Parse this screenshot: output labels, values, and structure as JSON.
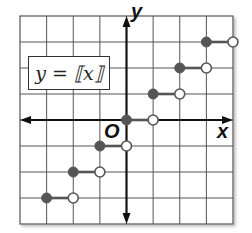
{
  "chart_data": {
    "type": "line",
    "title": "",
    "function_label": "y = ⟦x⟧",
    "xlabel": "x",
    "ylabel": "y",
    "origin_label": "O",
    "xlim": [
      -4,
      4
    ],
    "ylim": [
      -4,
      4
    ],
    "grid": true,
    "legend": "none",
    "series": [
      {
        "name": "y = [[x]]",
        "segments": [
          {
            "x_start": -3,
            "x_end": -2,
            "y": -3,
            "start": "closed",
            "end": "open"
          },
          {
            "x_start": -2,
            "x_end": -1,
            "y": -2,
            "start": "closed",
            "end": "open"
          },
          {
            "x_start": -1,
            "x_end": 0,
            "y": -1,
            "start": "closed",
            "end": "open"
          },
          {
            "x_start": 0,
            "x_end": 1,
            "y": 0,
            "start": "closed",
            "end": "open"
          },
          {
            "x_start": 1,
            "x_end": 2,
            "y": 1,
            "start": "closed",
            "end": "open"
          },
          {
            "x_start": 2,
            "x_end": 3,
            "y": 2,
            "start": "closed",
            "end": "open"
          },
          {
            "x_start": 3,
            "x_end": 4,
            "y": 3,
            "start": "closed",
            "end": "open"
          }
        ]
      }
    ],
    "colors": {
      "grid": "#555555",
      "axis": "#111111",
      "segment": "#555555",
      "dot": "#555555"
    }
  }
}
